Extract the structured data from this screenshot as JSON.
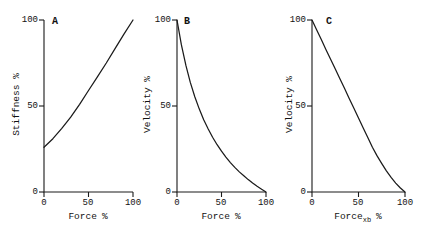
{
  "figure": {
    "background": "#ffffff",
    "line_color": "#1a1a1a"
  },
  "chart_data": [
    {
      "type": "line",
      "panel_label": "A",
      "xlabel_main": "Force",
      "xlabel_sub": "",
      "xlabel_unit": "%",
      "ylabel": "Stiffness %",
      "x_ticks": [
        "0",
        "50",
        "100"
      ],
      "y_ticks": [
        "0",
        "50",
        "100"
      ],
      "xlim": [
        0,
        100
      ],
      "ylim": [
        0,
        100
      ],
      "grid": false,
      "legend": false,
      "x": [
        0,
        10,
        20,
        30,
        40,
        50,
        60,
        70,
        80,
        90,
        100
      ],
      "y": [
        26,
        31,
        37,
        43.5,
        51,
        59,
        67,
        75,
        83.5,
        92,
        100
      ]
    },
    {
      "type": "line",
      "panel_label": "B",
      "xlabel_main": "Force",
      "xlabel_sub": "",
      "xlabel_unit": "%",
      "ylabel": "Velocity %",
      "x_ticks": [
        "0",
        "50",
        "100"
      ],
      "y_ticks": [
        "0",
        "50",
        "100"
      ],
      "xlim": [
        0,
        100
      ],
      "ylim": [
        0,
        100
      ],
      "grid": false,
      "legend": false,
      "x": [
        0,
        5,
        10,
        15,
        20,
        25,
        30,
        35,
        40,
        45,
        50,
        55,
        60,
        65,
        70,
        75,
        80,
        85,
        90,
        95,
        100
      ],
      "y": [
        100,
        85.5,
        73.6,
        63.7,
        55.4,
        48.2,
        42.0,
        36.6,
        31.8,
        27.5,
        23.7,
        20.3,
        17.1,
        14.3,
        11.7,
        9.4,
        7.2,
        5.2,
        3.3,
        1.6,
        0
      ]
    },
    {
      "type": "line",
      "panel_label": "C",
      "xlabel_main": "Force",
      "xlabel_sub": "xb",
      "xlabel_unit": "%",
      "ylabel": "Velocity %",
      "x_ticks": [
        "0",
        "50",
        "100"
      ],
      "y_ticks": [
        "0",
        "50",
        "100"
      ],
      "xlim": [
        0,
        100
      ],
      "ylim": [
        0,
        100
      ],
      "grid": false,
      "legend": false,
      "x": [
        0,
        5,
        10,
        15,
        20,
        25,
        30,
        35,
        40,
        45,
        50,
        55,
        60,
        65,
        70,
        75,
        80,
        85,
        90,
        95,
        100
      ],
      "y": [
        100,
        94.3,
        88.6,
        82.9,
        77.2,
        71.5,
        65.8,
        60.1,
        54.4,
        48.7,
        43.0,
        37.3,
        31.6,
        26.0,
        21.0,
        16.5,
        12.3,
        8.5,
        5.2,
        2.3,
        0
      ]
    }
  ]
}
